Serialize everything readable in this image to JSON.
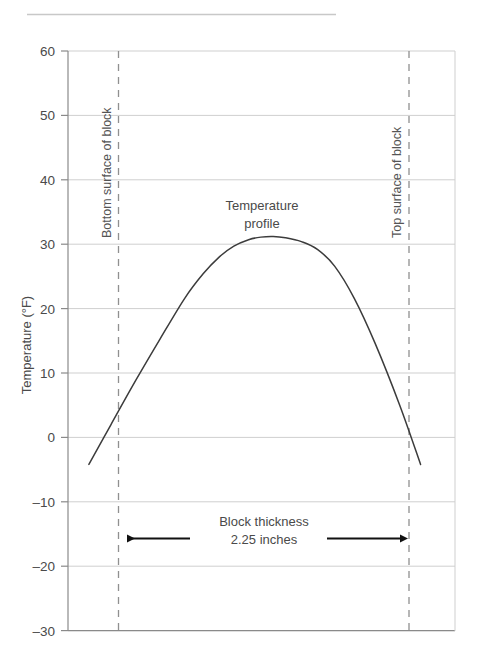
{
  "figure": {
    "rule_label": "header-rule"
  },
  "chart_data": {
    "type": "line",
    "title": "",
    "xlabel": "",
    "ylabel": "Temperature (°F)",
    "ylim": [
      -30,
      60
    ],
    "ytick_labels": [
      "60",
      "50",
      "40",
      "30",
      "20",
      "10",
      "0",
      "–10",
      "–20",
      "–30"
    ],
    "ytick_values": [
      60,
      50,
      40,
      30,
      20,
      10,
      0,
      -10,
      -20,
      -30
    ],
    "xlim": [
      -0.45,
      2.7
    ],
    "grid": true,
    "legend": "none",
    "series": [
      {
        "name": "Temperature profile",
        "x": [
          -0.28,
          -0.1,
          0.1,
          0.3,
          0.5,
          0.65,
          0.78,
          0.9,
          1.02,
          1.12,
          1.22,
          1.32,
          1.45,
          1.58,
          1.72,
          1.88,
          2.05,
          2.25,
          2.42
        ],
        "y": [
          -4.2,
          2.0,
          8.8,
          15.3,
          21.6,
          25.4,
          28.0,
          29.7,
          30.7,
          31.1,
          31.2,
          31.0,
          30.4,
          29.2,
          26.6,
          21.6,
          14.6,
          5.0,
          -4.2
        ]
      }
    ],
    "annotations": [
      {
        "name": "temperature-profile-label",
        "lines": [
          "Temperature",
          "profile"
        ],
        "x": 1.12,
        "y": 41
      },
      {
        "name": "block-thickness-label",
        "lines": [
          "Block thickness",
          "2.25 inches"
        ],
        "x": 1.12,
        "y": -14.5
      },
      {
        "name": "bottom-surface-label",
        "text": "Bottom surface of block",
        "rotation": -90
      },
      {
        "name": "top-surface-label",
        "text": "Top surface of block",
        "rotation": -90
      }
    ],
    "reference_lines": [
      {
        "name": "bottom-surface-line",
        "x": 0.0,
        "style": "dashed"
      },
      {
        "name": "top-surface-line",
        "x": 2.25,
        "style": "dashed"
      }
    ],
    "measure_arrow": {
      "name": "block-thickness-arrow",
      "from_x": 0.0,
      "to_x": 2.25,
      "y": -15.4,
      "value": "2.25 inches"
    }
  },
  "colors": {
    "background": "#ffffff",
    "gridline": "#cfcfcf",
    "axis": "#8a8a8a",
    "curve": "#3c3c3c",
    "dashed": "#909090",
    "arrow": "#111111",
    "text": "#4a4a4a",
    "rule": "#c8c8c8"
  }
}
